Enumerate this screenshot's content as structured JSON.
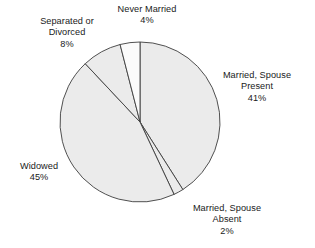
{
  "chart_data": {
    "type": "pie",
    "title": "",
    "subtitle": "",
    "xlabel": "",
    "ylabel": "",
    "grid": false,
    "legend_position": "none",
    "label_format": "name + percent",
    "total_percent": 100,
    "start_angle_deg": 0,
    "direction": "clockwise",
    "categories": [
      "Married, Spouse Present",
      "Married, Spouse Absent",
      "Widowed",
      "Separated or Divorced",
      "Never Married"
    ],
    "values": [
      41,
      2,
      45,
      8,
      4
    ],
    "slices": [
      {
        "id": "married-spouse-present",
        "name": "Married, Spouse Present",
        "name_lines": [
          "Married, Spouse",
          "Present"
        ],
        "value": 41,
        "percent_label": "41%",
        "start_angle_deg": 0,
        "end_angle_deg": 147.6,
        "fill": "#ebebeb",
        "stroke": "#3d3d3d"
      },
      {
        "id": "married-spouse-absent",
        "name": "Married, Spouse Absent",
        "name_lines": [
          "Married, Spouse",
          "Absent"
        ],
        "value": 2,
        "percent_label": "2%",
        "start_angle_deg": 147.6,
        "end_angle_deg": 154.8,
        "fill": "#ebebeb",
        "stroke": "#3d3d3d"
      },
      {
        "id": "widowed",
        "name": "Widowed",
        "name_lines": [
          "Widowed"
        ],
        "value": 45,
        "percent_label": "45%",
        "start_angle_deg": 154.8,
        "end_angle_deg": 316.8,
        "fill": "#ebebeb",
        "stroke": "#3d3d3d"
      },
      {
        "id": "separated-or-divorced",
        "name": "Separated or Divorced",
        "name_lines": [
          "Separated or",
          "Divorced"
        ],
        "value": 8,
        "percent_label": "8%",
        "start_angle_deg": 316.8,
        "end_angle_deg": 345.6,
        "fill": "#ebebeb",
        "stroke": "#3d3d3d"
      },
      {
        "id": "never-married",
        "name": "Never Married",
        "name_lines": [
          "Never Married"
        ],
        "value": 4,
        "percent_label": "4%",
        "start_angle_deg": 345.6,
        "end_angle_deg": 360,
        "fill": "#fbfbfb",
        "stroke": "#3d3d3d"
      }
    ]
  },
  "labels": {
    "never_married": {
      "line1": "Never Married",
      "line2": "4%"
    },
    "separated_divorced": {
      "line1": "Separated or",
      "line2": "Divorced",
      "line3": "8%"
    },
    "married_spouse_present": {
      "line1": "Married, Spouse",
      "line2": "Present",
      "line3": "41%"
    },
    "widowed": {
      "line1": "Widowed",
      "line2": "45%"
    },
    "married_spouse_absent": {
      "line1": "Married, Spouse",
      "line2": "Absent",
      "line3": "2%"
    }
  },
  "geometry": {
    "center_x": 140,
    "center_y": 122,
    "radius": 80
  },
  "colors": {
    "slice_fill": "#ebebeb",
    "slice_fill_light": "#fbfbfb",
    "outline": "#3d3d3d",
    "text": "#1a1a1a",
    "background": "#ffffff"
  }
}
